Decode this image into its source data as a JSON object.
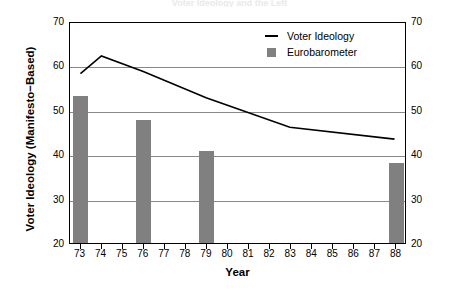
{
  "title_remnant": "Voter Ideology and the Left",
  "legend": {
    "position": "top-right",
    "entries": [
      {
        "label": "Voter Ideology",
        "marker": "line",
        "color": "#000000"
      },
      {
        "label": "Eurobarometer",
        "marker": "bar",
        "color": "#808080"
      }
    ]
  },
  "axes": {
    "ylabel": "Voter Ideology (Manifesto−Based)",
    "xlabel": "Year",
    "yticks": [
      "20",
      "30",
      "40",
      "50",
      "60",
      "70"
    ],
    "yticks_right": [
      "20",
      "30",
      "40",
      "50",
      "60",
      "70"
    ],
    "xticks": [
      "73",
      "74",
      "75",
      "76",
      "77",
      "78",
      "79",
      "80",
      "81",
      "82",
      "83",
      "84",
      "85",
      "86",
      "87",
      "88"
    ]
  },
  "chart_data": {
    "type": "bar",
    "title": "Voter Ideology and the Left",
    "xlabel": "Year",
    "ylabel": "Voter Ideology (Manifesto−Based)",
    "categories": [
      "73",
      "74",
      "75",
      "76",
      "77",
      "78",
      "79",
      "80",
      "81",
      "82",
      "83",
      "84",
      "85",
      "86",
      "87",
      "88"
    ],
    "ylim": [
      20,
      70
    ],
    "ytick_step": 10,
    "grid": true,
    "grid_axis": "y",
    "legend_position": "top-right",
    "series": [
      {
        "name": "Eurobarometer",
        "type": "bar",
        "color": "#808080",
        "x": [
          "73",
          "76",
          "79",
          "88"
        ],
        "values": [
          53.2,
          47.6,
          40.8,
          38.0
        ]
      },
      {
        "name": "Voter Ideology",
        "type": "line",
        "color": "#000000",
        "x": [
          "73",
          "74",
          "76",
          "79",
          "83",
          "88"
        ],
        "values": [
          58.5,
          62.5,
          59.0,
          53.0,
          46.3,
          43.6
        ]
      }
    ]
  }
}
